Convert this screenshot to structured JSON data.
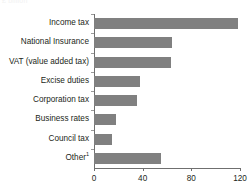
{
  "figure": {
    "top_remnant_text": "£ billion",
    "bar_color": "#808080",
    "axis_color": "#6f6f6f",
    "text_color": "#231f20"
  },
  "chart_data": {
    "type": "bar",
    "orientation": "horizontal",
    "title": "",
    "subtitle": "",
    "xlabel": "",
    "ylabel": "",
    "xlim": [
      0,
      120
    ],
    "xticks": [
      0,
      40,
      80,
      120
    ],
    "xtick_labels": [
      "0",
      "40",
      "80",
      "120"
    ],
    "grid": false,
    "legend": false,
    "categories": [
      "Income tax",
      "National Insurance",
      "VAT (value added tax)",
      "Excise duties",
      "Corporation tax",
      "Business rates",
      "Council tax",
      "Other"
    ],
    "category_labels": [
      "Income tax",
      "National Insurance",
      "VAT (value added tax)",
      "Excise duties",
      "Corporation tax",
      "Business rates",
      "Council tax",
      "Other"
    ],
    "category_footnotes": [
      "",
      "",
      "",
      "",
      "",
      "",
      "",
      "1"
    ],
    "values": [
      118,
      64,
      63,
      38,
      35,
      18,
      15,
      55
    ]
  }
}
